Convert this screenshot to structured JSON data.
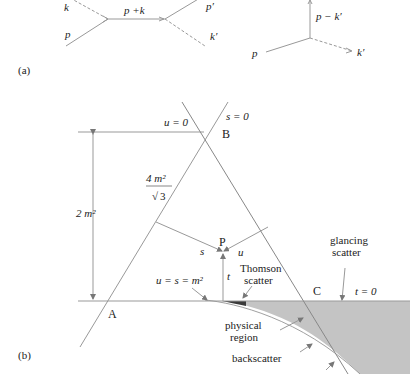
{
  "panel_a": {
    "label": "(a)",
    "s_channel": {
      "in_photon": "k",
      "in_electron": "p",
      "propagator": "p +k",
      "out_electron": "p′",
      "out_photon": "k′"
    },
    "u_channel": {
      "in_electron": "p",
      "propagator": "p − k′",
      "out_photon": "k′"
    }
  },
  "panel_b": {
    "label": "(b)",
    "line_u0": "u = 0",
    "line_s0": "s = 0",
    "line_t0": "t = 0",
    "vertex_a": "A",
    "vertex_b": "B",
    "vertex_c": "C",
    "point_p": "P",
    "dist_s": "s",
    "dist_u": "u",
    "dist_t": "t",
    "height_label": "2 m²",
    "side_num": "4 m²",
    "side_den": "3",
    "threshold_label": "u = s = m²",
    "thomson_line1": "Thomson",
    "thomson_line2": "scatter",
    "glancing_line1": "glancing",
    "glancing_line2": "scatter",
    "physical_line1": "physical",
    "physical_line2": "region",
    "backscatter": "backscatter",
    "colors": {
      "line": "#8a8a8a",
      "physical_region": "#c4c4c4",
      "thomson_region": "#3a3a3a"
    }
  }
}
